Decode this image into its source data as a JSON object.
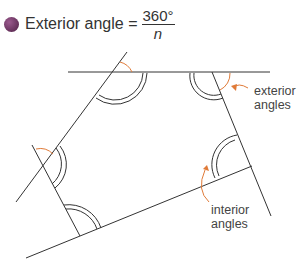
{
  "formula": {
    "label": "Exterior angle =",
    "numerator": "360°",
    "denominator": "n"
  },
  "labels": {
    "exterior": [
      "exterior",
      "angles"
    ],
    "interior": [
      "interior",
      "angles"
    ]
  },
  "colors": {
    "line": "#333333",
    "accent": "#e07b39",
    "bullet": "#6b2c5e"
  }
}
